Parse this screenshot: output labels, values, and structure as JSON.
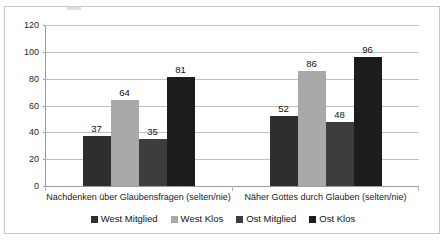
{
  "chart_data": {
    "type": "bar",
    "title": "",
    "subtitle": "",
    "xlabel": "",
    "ylabel": "",
    "categories": [
      "Nachdenken über Glaubensfragen (selten/nie)",
      "Näher Gottes durch Glauben (selten/nie)"
    ],
    "series": [
      {
        "name": "West Mitglied",
        "color": "#2e2e2e",
        "values": [
          37,
          52
        ]
      },
      {
        "name": "West Klos",
        "color": "#a9a9a9",
        "values": [
          64,
          86
        ]
      },
      {
        "name": "Ost Mitglied",
        "color": "#3d3d3d",
        "values": [
          35,
          48
        ]
      },
      {
        "name": "Ost Klos",
        "color": "#1c1c1c",
        "values": [
          81,
          96
        ]
      }
    ],
    "ylim": [
      0,
      120
    ],
    "yticks": [
      0,
      20,
      40,
      60,
      80,
      100,
      120
    ],
    "ytick_labels": [
      "0",
      "20",
      "40",
      "60",
      "80",
      "100",
      "120"
    ],
    "grid": "horizontal",
    "legend_position": "bottom",
    "data_labels": [
      37,
      64,
      35,
      81,
      52,
      86,
      48,
      96
    ],
    "colors": {
      "gridline": "#bfbfbf",
      "axis": "#9a9a9a",
      "border": "#c9c9c9",
      "background": "#ffffff",
      "text": "#1a1a1a"
    }
  },
  "legend": {
    "items": [
      {
        "label": "West Mitglied"
      },
      {
        "label": "West Klos"
      },
      {
        "label": "Ost Mitglied"
      },
      {
        "label": "Ost Klos"
      }
    ]
  }
}
